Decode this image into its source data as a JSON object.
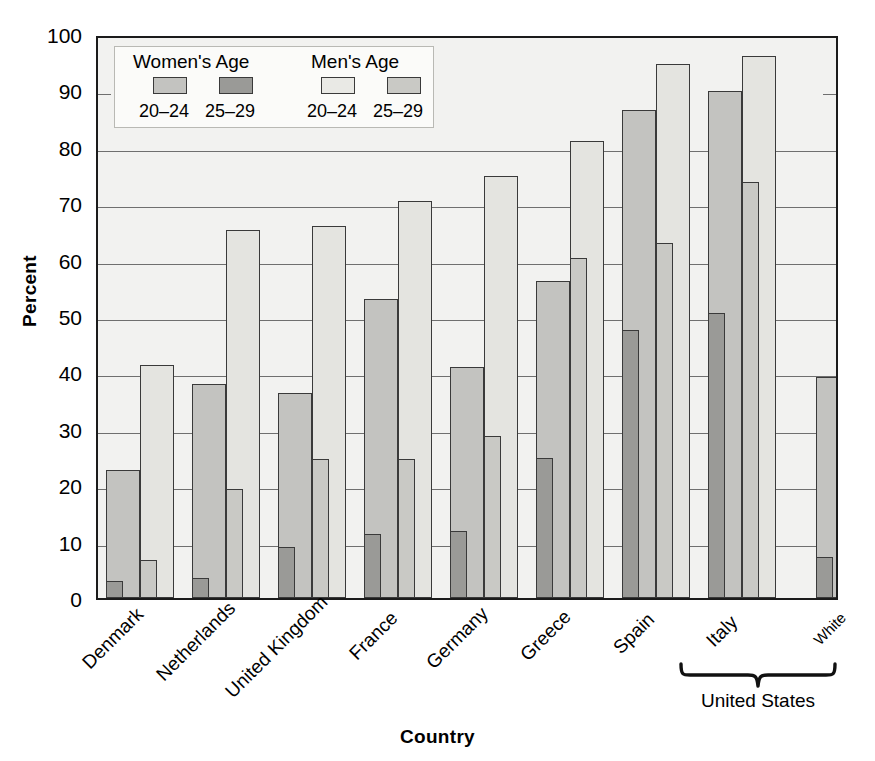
{
  "chart_data": {
    "type": "bar",
    "title": "",
    "xlabel": "Country",
    "ylabel": "Percent",
    "ylim": [
      0,
      100
    ],
    "ytick_labels": [
      "0",
      "10",
      "20",
      "30",
      "40",
      "50",
      "60",
      "70",
      "80",
      "90",
      "100"
    ],
    "ytick_values": [
      0,
      10,
      20,
      30,
      40,
      50,
      60,
      70,
      80,
      90,
      100
    ],
    "grid": true,
    "legend_position": "upper-left-inside",
    "categories": [
      "Denmark",
      "Netherlands",
      "United Kingdom",
      "France",
      "Germany",
      "Greece",
      "Spain",
      "Italy",
      "White",
      "Black",
      "Hispanic"
    ],
    "group_annotation": {
      "label": "United States",
      "covers": [
        "White",
        "Black",
        "Hispanic"
      ]
    },
    "series": [
      {
        "name": "Women's Age 20-24",
        "sex": "Women",
        "age": "20-24",
        "color": "#c3c3c0",
        "values": [
          22.7,
          38.0,
          36.4,
          53.0,
          41.0,
          56.2,
          86.5,
          89.9,
          39.2,
          47.7,
          54.6
        ]
      },
      {
        "name": "Women's Age 25-29",
        "sex": "Women",
        "age": "25-29",
        "color": "#9a9a97",
        "values": [
          3.0,
          3.6,
          9.0,
          11.3,
          11.8,
          24.9,
          47.5,
          50.6,
          7.3,
          16.3,
          25.1
        ]
      },
      {
        "name": "Men's Age 20-24",
        "sex": "Men",
        "age": "20-24",
        "color": "#e4e4e0",
        "values": [
          41.3,
          65.2,
          65.9,
          70.4,
          74.9,
          81.0,
          94.6,
          96.1,
          52.2,
          70.1,
          67.0
        ]
      },
      {
        "name": "Men's Age 25-29",
        "sex": "Men",
        "age": "25-29",
        "color": "#c9c9c5",
        "values": [
          6.7,
          19.3,
          24.6,
          24.7,
          28.7,
          60.3,
          62.9,
          73.8,
          16.0,
          30.1,
          34.4
        ]
      }
    ]
  },
  "legend": {
    "women_title": "Women's Age",
    "men_title": "Men's Age",
    "women_20_24": "20–24",
    "women_25_29": "25–29",
    "men_20_24": "20–24",
    "men_25_29": "25–29"
  },
  "axes": {
    "y_title": "Percent",
    "x_title": "Country"
  }
}
